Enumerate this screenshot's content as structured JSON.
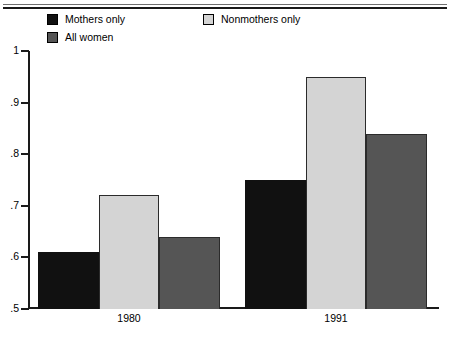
{
  "chart_data": {
    "type": "bar",
    "title": "",
    "xlabel": "",
    "ylabel": "",
    "categories": [
      "1980",
      "1991"
    ],
    "ylim": [
      0.5,
      1
    ],
    "ytick_labels": [
      "1",
      ".9",
      ".8",
      ".7",
      ".6",
      ".5"
    ],
    "ytick_values": [
      1,
      0.9,
      0.8,
      0.7,
      0.6,
      0.5
    ],
    "grid": false,
    "legend_position": "top",
    "series": [
      {
        "name": "Mothers only",
        "color": "#111111",
        "values": [
          0.61,
          0.75
        ]
      },
      {
        "name": "Nonmothers only",
        "color": "#d4d4d4",
        "values": [
          0.72,
          0.95
        ]
      },
      {
        "name": "All women",
        "color": "#555555",
        "values": [
          0.64,
          0.84
        ]
      }
    ]
  },
  "legend": {
    "column_one": [
      {
        "label": "Mothers only",
        "swatch": "black"
      },
      {
        "label": "All women",
        "swatch": "dark"
      }
    ],
    "column_two": [
      {
        "label": "Nonmothers only",
        "swatch": "light"
      }
    ]
  },
  "axes": {
    "y_labels": [
      "1",
      ".9",
      ".8",
      ".7",
      ".6",
      ".5"
    ],
    "x_labels": [
      "1980",
      "1991"
    ]
  }
}
